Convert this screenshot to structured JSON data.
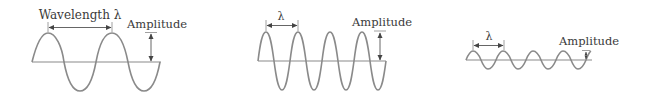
{
  "colors": {
    "wave": "#8a8a8a",
    "text": "#3a3a3a",
    "arrow": "#555555"
  },
  "panels": [
    {
      "id": "panel-1",
      "wavelength_label": "Wavelength λ",
      "amplitude_label": "Amplitude",
      "description": "long wavelength, large amplitude"
    },
    {
      "id": "panel-2",
      "wavelength_label": "λ",
      "amplitude_label": "Amplitude",
      "description": "short wavelength, large amplitude"
    },
    {
      "id": "panel-3",
      "wavelength_label": "λ",
      "amplitude_label": "Amplitude",
      "description": "short wavelength, small amplitude"
    }
  ]
}
